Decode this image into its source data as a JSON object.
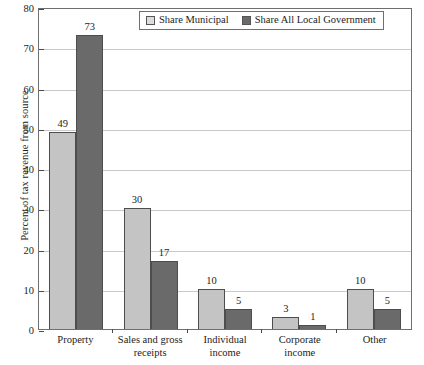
{
  "chart_data": {
    "type": "bar",
    "title": "",
    "xlabel": "",
    "ylabel": "Percent of tax revenue from source",
    "ylim": [
      0,
      80
    ],
    "ytick_step": 10,
    "yticks": [
      "0",
      "10",
      "20",
      "30",
      "40",
      "50",
      "60",
      "70",
      "80"
    ],
    "grid": true,
    "legend_position": "top-right-inside",
    "categories": [
      "Property",
      "Sales and gross receipts",
      "Individual income",
      "Corporate income",
      "Other"
    ],
    "category_lines": [
      [
        "Property"
      ],
      [
        "Sales and gross",
        "receipts"
      ],
      [
        "Individual",
        "income"
      ],
      [
        "Corporate",
        "income"
      ],
      [
        "Other"
      ]
    ],
    "series": [
      {
        "name": "Share Municipal",
        "color": "#c4c4c4",
        "values": [
          49,
          30,
          10,
          3,
          10
        ],
        "labels": [
          "49",
          "30",
          "10",
          "3",
          "10"
        ]
      },
      {
        "name": "Share All Local Government",
        "color": "#6a6a6a",
        "values": [
          73,
          17,
          5,
          1,
          5
        ],
        "labels": [
          "73",
          "17",
          "5",
          "1",
          "5"
        ]
      }
    ]
  },
  "legend": {
    "items": [
      {
        "label": "Share Municipal",
        "swatch": "light-gray-swatch"
      },
      {
        "label": "Share All Local Government",
        "swatch": "dark-gray-swatch"
      }
    ]
  }
}
